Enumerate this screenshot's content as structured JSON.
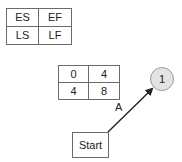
{
  "legend": {
    "cells": [
      "ES",
      "EF",
      "LS",
      "LF"
    ]
  },
  "start_node": {
    "label": "Start"
  },
  "activity": {
    "label": "A",
    "table": [
      "0",
      "4",
      "4",
      "8"
    ]
  },
  "end_node": {
    "label": "1"
  },
  "colors": {
    "border": "#6b6b6b",
    "circle_fill": "#e3e3e3",
    "circle_border": "#9a9a9a",
    "arrow": "#222222"
  }
}
